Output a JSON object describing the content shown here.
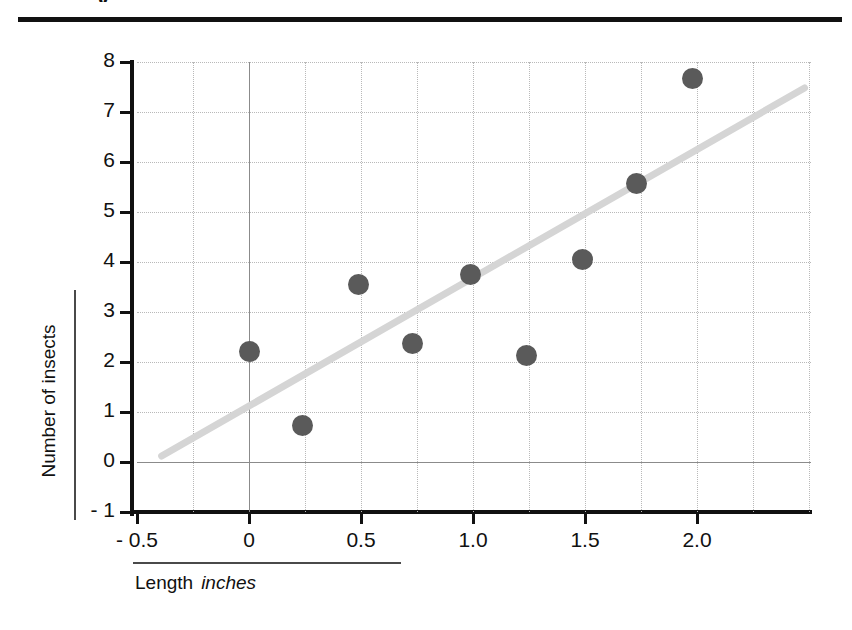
{
  "page": {
    "title_fragment": "y",
    "background_color": "#ffffff"
  },
  "chart_data": {
    "type": "scatter",
    "title": "",
    "xlabel": "Length",
    "xunit": "inches",
    "ylabel": "Number of insects",
    "xlim": [
      -0.5,
      2.5
    ],
    "ylim": [
      -1,
      8
    ],
    "grid": true,
    "legend": "none",
    "point_color": "#5a5a5a",
    "trendline_color": "#d5d5d5",
    "x_ticks": [
      -0.5,
      0,
      0.5,
      1.0,
      1.5,
      2.0
    ],
    "x_tick_labels": [
      "- 0.5",
      "0",
      "0.5",
      "1.0",
      "1.5",
      "2.0"
    ],
    "y_ticks": [
      -1,
      0,
      1,
      2,
      3,
      4,
      5,
      6,
      7,
      8
    ],
    "y_tick_labels": [
      "- 1",
      "0",
      "1",
      "2",
      "3",
      "4",
      "5",
      "6",
      "7",
      "8"
    ],
    "x": [
      0.0,
      0.24,
      0.49,
      0.73,
      0.99,
      1.24,
      1.49,
      1.73,
      1.98
    ],
    "y": [
      2.22,
      0.74,
      3.56,
      2.38,
      3.76,
      2.14,
      4.06,
      5.58,
      7.68
    ],
    "points": [
      {
        "x": 0.0,
        "y": 2.22
      },
      {
        "x": 0.24,
        "y": 0.74
      },
      {
        "x": 0.49,
        "y": 3.56
      },
      {
        "x": 0.73,
        "y": 2.38
      },
      {
        "x": 0.99,
        "y": 3.76
      },
      {
        "x": 1.24,
        "y": 2.14
      },
      {
        "x": 1.49,
        "y": 4.06
      },
      {
        "x": 1.73,
        "y": 5.58
      },
      {
        "x": 1.98,
        "y": 7.68
      }
    ],
    "trendline": {
      "x_start": -0.39,
      "y_start": 0.12,
      "x_end": 2.48,
      "y_end": 7.48
    }
  }
}
